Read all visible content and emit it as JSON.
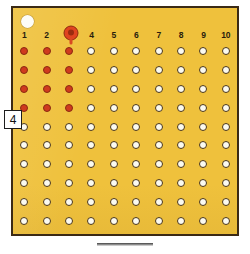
{
  "board": {
    "title": "dot-grid-board",
    "columns": 10,
    "rows": 10,
    "column_headers": [
      "1",
      "2",
      "3",
      "4",
      "5",
      "6",
      "7",
      "8",
      "9",
      "10"
    ],
    "panel_color": "#efc13c",
    "border_color": "#3b2a15",
    "filled_dot_color": "#cf3a1e",
    "empty_dot_color": "#fbfaf0",
    "dot_outline_color": "#4a3515",
    "filled_count": 12,
    "empty_count": 88,
    "cells": [
      [
        "filled",
        "filled",
        "filled",
        "empty",
        "empty",
        "empty",
        "empty",
        "empty",
        "empty",
        "empty"
      ],
      [
        "filled",
        "filled",
        "filled",
        "empty",
        "empty",
        "empty",
        "empty",
        "empty",
        "empty",
        "empty"
      ],
      [
        "filled",
        "filled",
        "filled",
        "empty",
        "empty",
        "empty",
        "empty",
        "empty",
        "empty",
        "empty"
      ],
      [
        "filled",
        "filled",
        "filled",
        "empty",
        "empty",
        "empty",
        "empty",
        "empty",
        "empty",
        "empty"
      ],
      [
        "empty",
        "empty",
        "empty",
        "empty",
        "empty",
        "empty",
        "empty",
        "empty",
        "empty",
        "empty"
      ],
      [
        "empty",
        "empty",
        "empty",
        "empty",
        "empty",
        "empty",
        "empty",
        "empty",
        "empty",
        "empty"
      ],
      [
        "empty",
        "empty",
        "empty",
        "empty",
        "empty",
        "empty",
        "empty",
        "empty",
        "empty",
        "empty"
      ],
      [
        "empty",
        "empty",
        "empty",
        "empty",
        "empty",
        "empty",
        "empty",
        "empty",
        "empty",
        "empty"
      ],
      [
        "empty",
        "empty",
        "empty",
        "empty",
        "empty",
        "empty",
        "empty",
        "empty",
        "empty",
        "empty"
      ],
      [
        "empty",
        "empty",
        "empty",
        "empty",
        "empty",
        "empty",
        "empty",
        "empty",
        "empty",
        "empty"
      ]
    ]
  },
  "cursor": {
    "label": "column-marker",
    "column": 3,
    "color": "#e0441f",
    "center_color": "#9b2c10"
  },
  "row_label": {
    "value": "4",
    "row": 5
  },
  "corner_indicator": {
    "label": "corner-circle",
    "color": "#fdfdf7"
  },
  "bottom_bar": {
    "label": "bottom-bar",
    "color": "#8b8b8b"
  }
}
